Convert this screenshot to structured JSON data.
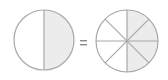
{
  "diagram": {
    "left_fraction": {
      "numerator": 1,
      "denominator": 2,
      "shaded_side": "right"
    },
    "operator": "=",
    "right_fraction": {
      "numerator": 4,
      "denominator": 8,
      "shaded_side": "right"
    }
  },
  "colors": {
    "stroke": "#a8a8a8",
    "shade": "#ececec",
    "background": "#ffffff"
  }
}
